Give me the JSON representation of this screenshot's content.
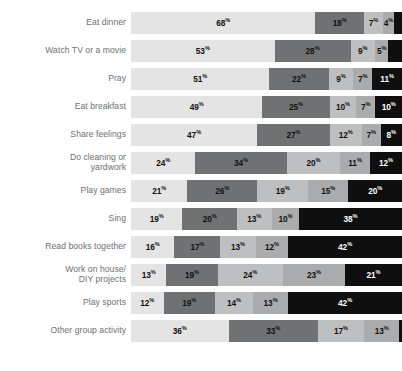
{
  "chart_data": {
    "type": "bar",
    "subtype": "horizontal-stacked-100",
    "title": "",
    "subtitle": "",
    "xlabel": "",
    "ylabel": "",
    "xlim": [
      0,
      100
    ],
    "grid": false,
    "legend_position": "none",
    "value_suffix": "%",
    "categories": [
      "Eat dinner",
      "Watch TV or a movie",
      "Pray",
      "Eat breakfast",
      "Share feelings",
      "Do cleaning or\nyardwork",
      "Play games",
      "Sing",
      "Read books together",
      "Work on house/\nDIY projects",
      "Play sports",
      "Other group activity"
    ],
    "series": [
      {
        "name": "Segment 1",
        "color": "#e4e4e4",
        "label_color": "#111111",
        "values": [
          68,
          53,
          51,
          49,
          47,
          24,
          21,
          19,
          16,
          13,
          12,
          36
        ]
      },
      {
        "name": "Segment 2",
        "color": "#6f7173",
        "label_color": "#111111",
        "values": [
          18,
          28,
          22,
          25,
          27,
          34,
          26,
          20,
          17,
          19,
          19,
          33
        ]
      },
      {
        "name": "Segment 3",
        "color": "#bebfc0",
        "label_color": "#111111",
        "values": [
          7,
          9,
          9,
          10,
          12,
          20,
          19,
          13,
          13,
          24,
          14,
          17
        ]
      },
      {
        "name": "Segment 4",
        "color": "#a9abad",
        "label_color": "#111111",
        "values": [
          4,
          5,
          7,
          7,
          7,
          11,
          15,
          10,
          12,
          23,
          13,
          13
        ]
      },
      {
        "name": "Segment 5",
        "color": "#100f0f",
        "label_color": "#ffffff",
        "values": [
          3,
          5,
          11,
          10,
          8,
          12,
          20,
          38,
          42,
          21,
          42,
          1
        ]
      }
    ],
    "labels_outside": [
      {
        "row": 0,
        "series": 4
      },
      {
        "row": 1,
        "series": 4
      },
      {
        "row": 11,
        "series": 4
      }
    ],
    "rows": [
      {
        "category": "Eat dinner",
        "values": [
          {
            "value": 68,
            "text": "68",
            "suffix": "%"
          },
          {
            "value": 18,
            "text": "18",
            "suffix": "%"
          },
          {
            "value": 7,
            "text": "7",
            "suffix": "%"
          },
          {
            "value": 4,
            "text": "4",
            "suffix": "%"
          },
          {
            "value": 3,
            "text": "3",
            "suffix": "%"
          }
        ]
      },
      {
        "category": "Watch TV or a movie",
        "values": [
          {
            "value": 53,
            "text": "53",
            "suffix": "%"
          },
          {
            "value": 28,
            "text": "28",
            "suffix": "%"
          },
          {
            "value": 9,
            "text": "9",
            "suffix": "%"
          },
          {
            "value": 5,
            "text": "5",
            "suffix": "%"
          },
          {
            "value": 5,
            "text": "5",
            "suffix": "%"
          }
        ]
      },
      {
        "category": "Pray",
        "values": [
          {
            "value": 51,
            "text": "51",
            "suffix": "%"
          },
          {
            "value": 22,
            "text": "22",
            "suffix": "%"
          },
          {
            "value": 9,
            "text": "9",
            "suffix": "%"
          },
          {
            "value": 7,
            "text": "7",
            "suffix": "%"
          },
          {
            "value": 11,
            "text": "11",
            "suffix": "%"
          }
        ]
      },
      {
        "category": "Eat breakfast",
        "values": [
          {
            "value": 49,
            "text": "49",
            "suffix": "%"
          },
          {
            "value": 25,
            "text": "25",
            "suffix": "%"
          },
          {
            "value": 10,
            "text": "10",
            "suffix": "%"
          },
          {
            "value": 7,
            "text": "7",
            "suffix": "%"
          },
          {
            "value": 10,
            "text": "10",
            "suffix": "%"
          }
        ]
      },
      {
        "category": "Share feelings",
        "values": [
          {
            "value": 47,
            "text": "47",
            "suffix": "%"
          },
          {
            "value": 27,
            "text": "27",
            "suffix": "%"
          },
          {
            "value": 12,
            "text": "12",
            "suffix": "%"
          },
          {
            "value": 7,
            "text": "7",
            "suffix": "%"
          },
          {
            "value": 8,
            "text": "8",
            "suffix": "%"
          }
        ]
      },
      {
        "category": "Do cleaning or yardwork",
        "values": [
          {
            "value": 24,
            "text": "24",
            "suffix": "%"
          },
          {
            "value": 34,
            "text": "34",
            "suffix": "%"
          },
          {
            "value": 20,
            "text": "20",
            "suffix": "%"
          },
          {
            "value": 11,
            "text": "11",
            "suffix": "%"
          },
          {
            "value": 12,
            "text": "12",
            "suffix": "%"
          }
        ]
      },
      {
        "category": "Play games",
        "values": [
          {
            "value": 21,
            "text": "21",
            "suffix": "%"
          },
          {
            "value": 26,
            "text": "26",
            "suffix": "%"
          },
          {
            "value": 19,
            "text": "19",
            "suffix": "%"
          },
          {
            "value": 15,
            "text": "15",
            "suffix": "%"
          },
          {
            "value": 20,
            "text": "20",
            "suffix": "%"
          }
        ]
      },
      {
        "category": "Sing",
        "values": [
          {
            "value": 19,
            "text": "19",
            "suffix": "%"
          },
          {
            "value": 20,
            "text": "20",
            "suffix": "%"
          },
          {
            "value": 13,
            "text": "13",
            "suffix": "%"
          },
          {
            "value": 10,
            "text": "10",
            "suffix": "%"
          },
          {
            "value": 38,
            "text": "38",
            "suffix": "%"
          }
        ]
      },
      {
        "category": "Read books together",
        "values": [
          {
            "value": 16,
            "text": "16",
            "suffix": "%"
          },
          {
            "value": 17,
            "text": "17",
            "suffix": "%"
          },
          {
            "value": 13,
            "text": "13",
            "suffix": "%"
          },
          {
            "value": 12,
            "text": "12",
            "suffix": "%"
          },
          {
            "value": 42,
            "text": "42",
            "suffix": "%"
          }
        ]
      },
      {
        "category": "Work on house/ DIY projects",
        "values": [
          {
            "value": 13,
            "text": "13",
            "suffix": "%"
          },
          {
            "value": 19,
            "text": "19",
            "suffix": "%"
          },
          {
            "value": 24,
            "text": "24",
            "suffix": "%"
          },
          {
            "value": 23,
            "text": "23",
            "suffix": "%"
          },
          {
            "value": 21,
            "text": "21",
            "suffix": "%"
          }
        ]
      },
      {
        "category": "Play sports",
        "values": [
          {
            "value": 12,
            "text": "12",
            "suffix": "%"
          },
          {
            "value": 19,
            "text": "19",
            "suffix": "%"
          },
          {
            "value": 14,
            "text": "14",
            "suffix": "%"
          },
          {
            "value": 13,
            "text": "13",
            "suffix": "%"
          },
          {
            "value": 42,
            "text": "42",
            "suffix": "%"
          }
        ]
      },
      {
        "category": "Other group activity",
        "values": [
          {
            "value": 36,
            "text": "36",
            "suffix": "%"
          },
          {
            "value": 33,
            "text": "33",
            "suffix": "%"
          },
          {
            "value": 17,
            "text": "17",
            "suffix": "%"
          },
          {
            "value": 13,
            "text": "13",
            "suffix": "%"
          },
          {
            "value": 1,
            "text": "1",
            "suffix": "%"
          }
        ]
      }
    ]
  }
}
